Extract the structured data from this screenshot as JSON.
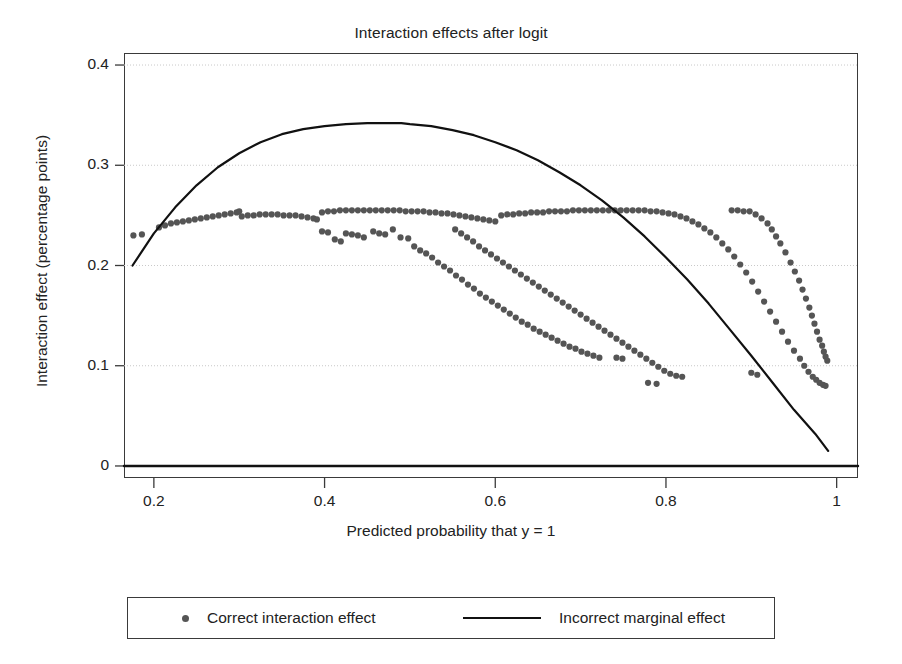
{
  "chart_data": {
    "type": "scatter",
    "title": "Interaction effects after logit",
    "xlabel": "Predicted probability that y = 1",
    "ylabel": "Interaction effect (percentage points)",
    "xlim": [
      0.165,
      1.025
    ],
    "ylim": [
      -0.012,
      0.412
    ],
    "xticks": [
      "0.2",
      "0.4",
      "0.6",
      "0.8",
      "1"
    ],
    "xtick_values": [
      0.2,
      0.4,
      0.6,
      0.8,
      1.0
    ],
    "yticks": [
      "0",
      "0.1",
      "0.2",
      "0.3",
      "0.4"
    ],
    "ytick_values": [
      0,
      0.1,
      0.2,
      0.3,
      0.4
    ],
    "grid": "horizontal-dotted",
    "legend_position": "below-plot",
    "series": [
      {
        "name": "Correct interaction effect",
        "type": "scatter",
        "marker": "dot",
        "color": "#555555",
        "points": [
          [
            0.176,
            0.23
          ],
          [
            0.186,
            0.231
          ],
          [
            0.206,
            0.238
          ],
          [
            0.213,
            0.24
          ],
          [
            0.22,
            0.242
          ],
          [
            0.227,
            0.243
          ],
          [
            0.234,
            0.244
          ],
          [
            0.241,
            0.245
          ],
          [
            0.248,
            0.246
          ],
          [
            0.255,
            0.247
          ],
          [
            0.262,
            0.248
          ],
          [
            0.269,
            0.249
          ],
          [
            0.276,
            0.25
          ],
          [
            0.283,
            0.251
          ],
          [
            0.29,
            0.252
          ],
          [
            0.297,
            0.253
          ],
          [
            0.3,
            0.254
          ],
          [
            0.303,
            0.249
          ],
          [
            0.31,
            0.25
          ],
          [
            0.317,
            0.25
          ],
          [
            0.324,
            0.251
          ],
          [
            0.331,
            0.251
          ],
          [
            0.338,
            0.251
          ],
          [
            0.345,
            0.251
          ],
          [
            0.352,
            0.25
          ],
          [
            0.359,
            0.25
          ],
          [
            0.366,
            0.25
          ],
          [
            0.373,
            0.249
          ],
          [
            0.38,
            0.248
          ],
          [
            0.387,
            0.247
          ],
          [
            0.391,
            0.246
          ],
          [
            0.397,
            0.253
          ],
          [
            0.404,
            0.254
          ],
          [
            0.411,
            0.254
          ],
          [
            0.418,
            0.255
          ],
          [
            0.425,
            0.255
          ],
          [
            0.432,
            0.255
          ],
          [
            0.439,
            0.255
          ],
          [
            0.446,
            0.255
          ],
          [
            0.453,
            0.255
          ],
          [
            0.46,
            0.255
          ],
          [
            0.467,
            0.255
          ],
          [
            0.474,
            0.255
          ],
          [
            0.481,
            0.255
          ],
          [
            0.488,
            0.255
          ],
          [
            0.495,
            0.254
          ],
          [
            0.502,
            0.254
          ],
          [
            0.509,
            0.254
          ],
          [
            0.516,
            0.254
          ],
          [
            0.523,
            0.253
          ],
          [
            0.53,
            0.253
          ],
          [
            0.537,
            0.252
          ],
          [
            0.544,
            0.252
          ],
          [
            0.551,
            0.251
          ],
          [
            0.558,
            0.25
          ],
          [
            0.565,
            0.249
          ],
          [
            0.572,
            0.248
          ],
          [
            0.579,
            0.247
          ],
          [
            0.586,
            0.246
          ],
          [
            0.593,
            0.245
          ],
          [
            0.6,
            0.244
          ],
          [
            0.607,
            0.25
          ],
          [
            0.614,
            0.251
          ],
          [
            0.621,
            0.251
          ],
          [
            0.628,
            0.252
          ],
          [
            0.635,
            0.252
          ],
          [
            0.642,
            0.253
          ],
          [
            0.649,
            0.253
          ],
          [
            0.656,
            0.253
          ],
          [
            0.663,
            0.254
          ],
          [
            0.67,
            0.254
          ],
          [
            0.677,
            0.254
          ],
          [
            0.684,
            0.254
          ],
          [
            0.691,
            0.255
          ],
          [
            0.698,
            0.255
          ],
          [
            0.705,
            0.255
          ],
          [
            0.712,
            0.255
          ],
          [
            0.719,
            0.255
          ],
          [
            0.726,
            0.255
          ],
          [
            0.733,
            0.255
          ],
          [
            0.74,
            0.255
          ],
          [
            0.747,
            0.255
          ],
          [
            0.754,
            0.255
          ],
          [
            0.761,
            0.255
          ],
          [
            0.768,
            0.255
          ],
          [
            0.775,
            0.255
          ],
          [
            0.782,
            0.254
          ],
          [
            0.789,
            0.254
          ],
          [
            0.796,
            0.253
          ],
          [
            0.803,
            0.252
          ],
          [
            0.81,
            0.251
          ],
          [
            0.817,
            0.249
          ],
          [
            0.824,
            0.247
          ],
          [
            0.831,
            0.244
          ],
          [
            0.838,
            0.241
          ],
          [
            0.845,
            0.237
          ],
          [
            0.852,
            0.233
          ],
          [
            0.859,
            0.228
          ],
          [
            0.866,
            0.222
          ],
          [
            0.873,
            0.216
          ],
          [
            0.88,
            0.209
          ],
          [
            0.887,
            0.201
          ],
          [
            0.894,
            0.193
          ],
          [
            0.901,
            0.184
          ],
          [
            0.908,
            0.174
          ],
          [
            0.915,
            0.164
          ],
          [
            0.922,
            0.154
          ],
          [
            0.929,
            0.144
          ],
          [
            0.936,
            0.134
          ],
          [
            0.943,
            0.124
          ],
          [
            0.95,
            0.115
          ],
          [
            0.957,
            0.107
          ],
          [
            0.962,
            0.1
          ],
          [
            0.967,
            0.094
          ],
          [
            0.972,
            0.089
          ],
          [
            0.976,
            0.086
          ],
          [
            0.98,
            0.083
          ],
          [
            0.984,
            0.081
          ],
          [
            0.987,
            0.08
          ],
          [
            0.877,
            0.255
          ],
          [
            0.884,
            0.255
          ],
          [
            0.891,
            0.254
          ],
          [
            0.898,
            0.254
          ],
          [
            0.905,
            0.251
          ],
          [
            0.912,
            0.247
          ],
          [
            0.919,
            0.242
          ],
          [
            0.924,
            0.236
          ],
          [
            0.929,
            0.229
          ],
          [
            0.934,
            0.222
          ],
          [
            0.94,
            0.213
          ],
          [
            0.946,
            0.203
          ],
          [
            0.951,
            0.194
          ],
          [
            0.956,
            0.185
          ],
          [
            0.96,
            0.176
          ],
          [
            0.964,
            0.167
          ],
          [
            0.968,
            0.158
          ],
          [
            0.971,
            0.15
          ],
          [
            0.974,
            0.142
          ],
          [
            0.977,
            0.134
          ],
          [
            0.98,
            0.126
          ],
          [
            0.983,
            0.12
          ],
          [
            0.985,
            0.114
          ],
          [
            0.987,
            0.109
          ],
          [
            0.989,
            0.105
          ],
          [
            0.457,
            0.234
          ],
          [
            0.464,
            0.232
          ],
          [
            0.471,
            0.231
          ],
          [
            0.48,
            0.236
          ],
          [
            0.489,
            0.228
          ],
          [
            0.498,
            0.227
          ],
          [
            0.505,
            0.219
          ],
          [
            0.512,
            0.215
          ],
          [
            0.519,
            0.212
          ],
          [
            0.526,
            0.208
          ],
          [
            0.533,
            0.203
          ],
          [
            0.54,
            0.199
          ],
          [
            0.547,
            0.195
          ],
          [
            0.554,
            0.19
          ],
          [
            0.561,
            0.186
          ],
          [
            0.568,
            0.181
          ],
          [
            0.575,
            0.177
          ],
          [
            0.582,
            0.172
          ],
          [
            0.589,
            0.168
          ],
          [
            0.596,
            0.164
          ],
          [
            0.603,
            0.16
          ],
          [
            0.61,
            0.156
          ],
          [
            0.617,
            0.152
          ],
          [
            0.624,
            0.148
          ],
          [
            0.631,
            0.144
          ],
          [
            0.638,
            0.141
          ],
          [
            0.645,
            0.137
          ],
          [
            0.652,
            0.134
          ],
          [
            0.659,
            0.131
          ],
          [
            0.666,
            0.128
          ],
          [
            0.673,
            0.125
          ],
          [
            0.68,
            0.122
          ],
          [
            0.687,
            0.119
          ],
          [
            0.694,
            0.117
          ],
          [
            0.701,
            0.114
          ],
          [
            0.708,
            0.112
          ],
          [
            0.715,
            0.11
          ],
          [
            0.722,
            0.108
          ],
          [
            0.742,
            0.108
          ],
          [
            0.749,
            0.107
          ],
          [
            0.425,
            0.232
          ],
          [
            0.432,
            0.231
          ],
          [
            0.439,
            0.23
          ],
          [
            0.446,
            0.228
          ],
          [
            0.397,
            0.234
          ],
          [
            0.404,
            0.233
          ],
          [
            0.412,
            0.226
          ],
          [
            0.419,
            0.224
          ],
          [
            0.779,
            0.083
          ],
          [
            0.789,
            0.082
          ],
          [
            0.553,
            0.236
          ],
          [
            0.56,
            0.232
          ],
          [
            0.567,
            0.228
          ],
          [
            0.574,
            0.224
          ],
          [
            0.581,
            0.219
          ],
          [
            0.588,
            0.215
          ],
          [
            0.595,
            0.211
          ],
          [
            0.602,
            0.207
          ],
          [
            0.609,
            0.203
          ],
          [
            0.616,
            0.199
          ],
          [
            0.623,
            0.195
          ],
          [
            0.63,
            0.191
          ],
          [
            0.637,
            0.187
          ],
          [
            0.644,
            0.183
          ],
          [
            0.651,
            0.179
          ],
          [
            0.658,
            0.175
          ],
          [
            0.665,
            0.171
          ],
          [
            0.672,
            0.167
          ],
          [
            0.679,
            0.163
          ],
          [
            0.686,
            0.159
          ],
          [
            0.693,
            0.155
          ],
          [
            0.7,
            0.151
          ],
          [
            0.707,
            0.147
          ],
          [
            0.714,
            0.143
          ],
          [
            0.721,
            0.139
          ],
          [
            0.728,
            0.135
          ],
          [
            0.735,
            0.131
          ],
          [
            0.742,
            0.127
          ],
          [
            0.749,
            0.123
          ],
          [
            0.756,
            0.119
          ],
          [
            0.763,
            0.115
          ],
          [
            0.77,
            0.111
          ],
          [
            0.777,
            0.107
          ],
          [
            0.784,
            0.103
          ],
          [
            0.791,
            0.099
          ],
          [
            0.798,
            0.095
          ],
          [
            0.805,
            0.092
          ],
          [
            0.812,
            0.09
          ],
          [
            0.819,
            0.089
          ],
          [
            0.9,
            0.093
          ],
          [
            0.907,
            0.091
          ]
        ]
      },
      {
        "name": "Incorrect marginal effect",
        "type": "line",
        "color": "#111111",
        "points": [
          [
            0.175,
            0.2
          ],
          [
            0.2,
            0.232
          ],
          [
            0.225,
            0.258
          ],
          [
            0.25,
            0.28
          ],
          [
            0.275,
            0.298
          ],
          [
            0.3,
            0.312
          ],
          [
            0.325,
            0.323
          ],
          [
            0.35,
            0.331
          ],
          [
            0.375,
            0.336
          ],
          [
            0.4,
            0.339
          ],
          [
            0.425,
            0.341
          ],
          [
            0.45,
            0.342
          ],
          [
            0.475,
            0.342
          ],
          [
            0.49,
            0.342
          ],
          [
            0.5,
            0.341
          ],
          [
            0.525,
            0.339
          ],
          [
            0.55,
            0.335
          ],
          [
            0.575,
            0.33
          ],
          [
            0.6,
            0.323
          ],
          [
            0.625,
            0.315
          ],
          [
            0.65,
            0.305
          ],
          [
            0.675,
            0.293
          ],
          [
            0.7,
            0.28
          ],
          [
            0.725,
            0.265
          ],
          [
            0.75,
            0.248
          ],
          [
            0.775,
            0.229
          ],
          [
            0.8,
            0.208
          ],
          [
            0.825,
            0.186
          ],
          [
            0.85,
            0.162
          ],
          [
            0.875,
            0.136
          ],
          [
            0.9,
            0.11
          ],
          [
            0.925,
            0.083
          ],
          [
            0.95,
            0.056
          ],
          [
            0.975,
            0.032
          ],
          [
            0.99,
            0.015
          ]
        ]
      },
      {
        "name": "zero-reference-line",
        "type": "line",
        "color": "#111111",
        "points": [
          [
            0.165,
            0.0
          ],
          [
            1.025,
            0.0
          ]
        ]
      }
    ]
  },
  "legend": {
    "items": [
      {
        "label": "Correct interaction effect",
        "marker": "dot"
      },
      {
        "label": "Incorrect marginal effect",
        "marker": "line"
      }
    ]
  }
}
